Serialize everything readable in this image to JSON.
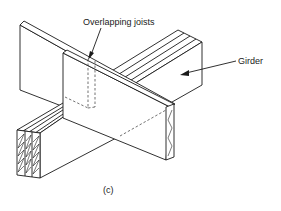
{
  "diagram": {
    "type": "isometric construction detail",
    "labels": {
      "overlapping_joists": "Overlapping joists",
      "girder": "Girder",
      "caption": "(c)"
    },
    "components": [
      {
        "name": "back-joist",
        "description": "rear joist running diagonally, partially hidden"
      },
      {
        "name": "front-joist",
        "description": "front joist overlapping the back joist, end grain hatched at right"
      },
      {
        "name": "girder",
        "description": "built-up girder (3 plies) crossing beneath joists, end grain hatched at lower left"
      }
    ],
    "colors": {
      "line": "#1a1a1a",
      "background": "#ffffff"
    }
  }
}
